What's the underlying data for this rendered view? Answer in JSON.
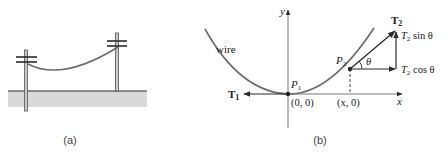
{
  "figure_a": {
    "caption": "(a)",
    "description": "Power line wire hanging between two utility poles above ground"
  },
  "figure_b": {
    "caption": "(b)",
    "axes": {
      "x_label": "x",
      "y_label": "y"
    },
    "curve_label": "wire",
    "points": {
      "p1": {
        "label": "P",
        "subscript": "1",
        "coord_label": "(0, 0)"
      },
      "p2": {
        "label": "P",
        "subscript": "2",
        "coord_label": "(x, 0)"
      }
    },
    "vectors": {
      "t1": {
        "label": "T",
        "subscript": "1"
      },
      "t2": {
        "label": "T",
        "subscript": "2"
      },
      "t2_sin": {
        "label": "T",
        "subscript": "2",
        "suffix": " sin θ"
      },
      "t2_cos": {
        "label": "T",
        "subscript": "2",
        "suffix": " cos θ"
      }
    },
    "angle_label": "θ"
  },
  "colors": {
    "wire": "#6b6b6b",
    "line": "#2a2a2a",
    "ground": "#d9d9d9",
    "pole": "#9a9a9a",
    "text": "#222222"
  }
}
